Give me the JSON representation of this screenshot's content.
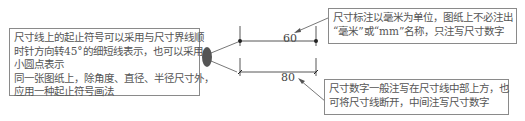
{
  "diagram": {
    "callouts": {
      "left": {
        "lines": [
          "尺寸线上的起止符号可以采用与尺寸界线顺",
          "时针方向转45°的细短线表示，也可以采用",
          "小圆点表示",
          "同一张图纸上，除角度、直径、半径尺寸外，",
          "应用一种起止符号画法"
        ]
      },
      "top_right": {
        "lines": [
          "尺寸标注以毫米为单位，图纸上不必注出",
          "“毫米”或“mm”名称，只注写尺寸数字"
        ]
      },
      "bottom_right": {
        "lines": [
          "尺寸数字一般注写在尺寸线中部上方，也",
          "可将尺寸线断开，中间注写尺寸数字"
        ]
      }
    },
    "dimensions": {
      "top": {
        "value": "60",
        "terminator": "dot"
      },
      "bottom": {
        "value": "80",
        "terminator": "tick"
      }
    },
    "colors": {
      "line": "#444444",
      "border": "#8a8a8a",
      "ellipse": "#555555",
      "text": "#555555"
    }
  }
}
